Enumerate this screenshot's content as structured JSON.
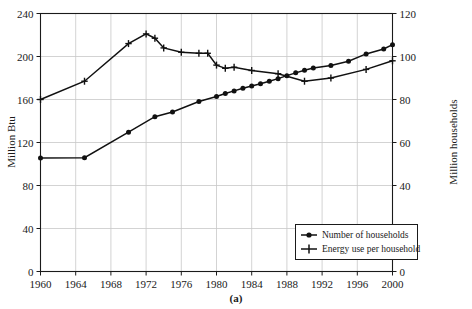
{
  "caption": "(a)",
  "chart_data": {
    "type": "line",
    "title": "",
    "xlabel": "",
    "grid": true,
    "legend_position": "bottom-right",
    "x": [
      1960,
      1965,
      1970,
      1973,
      1975,
      1978,
      1980,
      1981,
      1982,
      1983,
      1984,
      1985,
      1986,
      1987,
      1988,
      1989,
      1990,
      1991,
      1992,
      1993,
      1994,
      1995,
      1996,
      1997,
      1998,
      1999,
      2000
    ],
    "xlim": [
      1960,
      2000
    ],
    "xticks": [
      1960,
      1964,
      1968,
      1972,
      1976,
      1980,
      1984,
      1988,
      1992,
      1996,
      2000
    ],
    "axes": [
      {
        "id": "left",
        "ylabel": "Million Btu",
        "ylim": [
          0,
          240
        ],
        "yticks": [
          0,
          40,
          80,
          120,
          160,
          200,
          240
        ]
      },
      {
        "id": "right",
        "ylabel": "Million households",
        "ylim": [
          0,
          120
        ],
        "yticks": [
          0,
          20,
          40,
          60,
          80,
          100,
          120
        ]
      }
    ],
    "series": [
      {
        "name": "Number of households",
        "axis": "right",
        "marker": "filled-circle",
        "units": "Million households",
        "x": [
          1960,
          1965,
          1970,
          1973,
          1975,
          1978,
          1980,
          1981,
          1982,
          1983,
          1984,
          1985,
          1986,
          1987,
          1988,
          1989,
          1990,
          1991,
          1993,
          1995,
          1997,
          1999,
          2000
        ],
        "values": [
          52.8,
          52.9,
          64.8,
          72.0,
          74.2,
          79.1,
          81.4,
          82.8,
          84.0,
          85.2,
          86.3,
          87.3,
          88.5,
          89.7,
          91.1,
          92.4,
          93.6,
          94.6,
          95.8,
          97.8,
          101.2,
          103.5,
          105.5
        ]
      },
      {
        "name": "Energy use per household",
        "axis": "left",
        "marker": "plus",
        "units": "Million Btu",
        "x": [
          1960,
          1965,
          1970,
          1972,
          1973,
          1974,
          1976,
          1978,
          1979,
          1980,
          1981,
          1982,
          1984,
          1987,
          1990,
          1993,
          1997,
          2000
        ],
        "values": [
          160,
          177,
          212,
          221,
          217,
          208,
          204,
          203,
          203,
          192,
          189,
          190,
          187,
          184,
          177,
          180,
          188,
          196
        ]
      }
    ],
    "legend": [
      {
        "label": "Number of households",
        "marker": "filled-circle"
      },
      {
        "label": "Energy use per household",
        "marker": "plus"
      }
    ]
  },
  "colors": {
    "line": "#111111",
    "grid": "#c8c8c8",
    "frame": "#1a1a1a",
    "background": "#ffffff"
  }
}
